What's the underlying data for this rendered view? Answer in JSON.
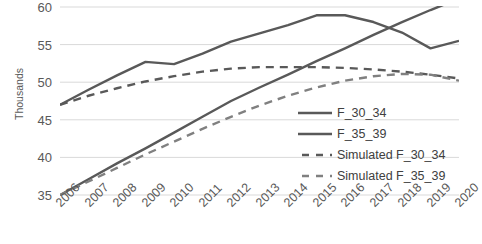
{
  "chart_data": {
    "type": "line",
    "title": "",
    "xlabel": "",
    "ylabel": "Thousands",
    "ylim": [
      35,
      60
    ],
    "yticks": [
      35,
      40,
      45,
      50,
      55,
      60
    ],
    "grid": true,
    "legend_position": "inside-right",
    "x": [
      "2006",
      "2007",
      "2008",
      "2009",
      "2010",
      "2011",
      "2012",
      "2013",
      "2014",
      "2015",
      "2016",
      "2017",
      "2018",
      "2019",
      "2020"
    ],
    "series": [
      {
        "name": "F_30_34",
        "style": "solid",
        "color": "#595959",
        "values": [
          35.0,
          37.1,
          39.2,
          41.2,
          43.3,
          45.4,
          47.5,
          49.3,
          51.0,
          52.8,
          54.5,
          56.3,
          58.0,
          59.6,
          61.1
        ]
      },
      {
        "name": "F_35_39",
        "style": "solid",
        "color": "#595959",
        "values": [
          47.0,
          49.0,
          50.9,
          52.7,
          52.4,
          53.8,
          55.4,
          56.5,
          57.6,
          58.9,
          58.9,
          58.0,
          56.6,
          54.5,
          55.5
        ]
      },
      {
        "name": "Simulated F_30_34",
        "style": "dashed",
        "color": "#595959",
        "values": [
          47.0,
          48.2,
          49.2,
          50.1,
          50.8,
          51.4,
          51.8,
          52.0,
          52.0,
          52.0,
          51.9,
          51.7,
          51.4,
          51.0,
          50.5
        ]
      },
      {
        "name": "Simulated F_35_39",
        "style": "dashed",
        "color": "#808080",
        "values": [
          35.0,
          36.8,
          38.6,
          40.4,
          42.1,
          43.8,
          45.4,
          46.9,
          48.2,
          49.3,
          50.2,
          50.8,
          51.1,
          51.0,
          50.2
        ]
      }
    ]
  },
  "axis": {
    "y_title": "Thousands",
    "y_tick_labels": [
      "60",
      "55",
      "50",
      "45",
      "40",
      "35"
    ],
    "x_tick_labels": [
      "2006",
      "2007",
      "2008",
      "2009",
      "2010",
      "2011",
      "2012",
      "2013",
      "2014",
      "2015",
      "2016",
      "2017",
      "2018",
      "2019",
      "2020"
    ]
  },
  "legend": {
    "items": [
      {
        "label": "F_30_34",
        "style": "solid"
      },
      {
        "label": "F_35_39",
        "style": "solid"
      },
      {
        "label": "Simulated F_30_34",
        "style": "dashed"
      },
      {
        "label": "Simulated F_35_39",
        "style": "dashed"
      }
    ]
  },
  "colors": {
    "line_dark": "#595959",
    "line_mid": "#808080",
    "grid": "#d9d9d9",
    "text": "#595959",
    "background": "#ffffff"
  }
}
